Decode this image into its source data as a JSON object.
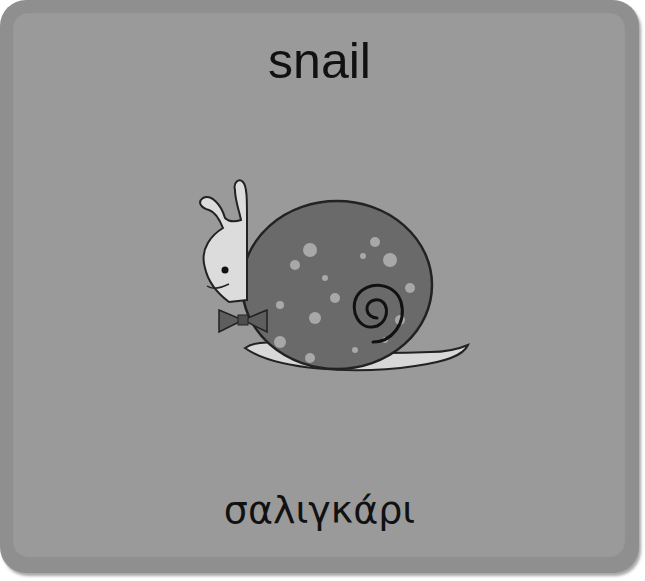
{
  "card": {
    "word_english": "snail",
    "word_greek": "σαλιγκάρι",
    "image": {
      "subject": "snail-illustration",
      "description": "Cartoon snail with spotted spiral shell and bow tie"
    },
    "colors": {
      "card_outer": "#8f8f8f",
      "card_inner": "#9a9a9a",
      "text": "#111111",
      "shell": "#6a6a6a",
      "body": "#d8d8d8"
    }
  }
}
